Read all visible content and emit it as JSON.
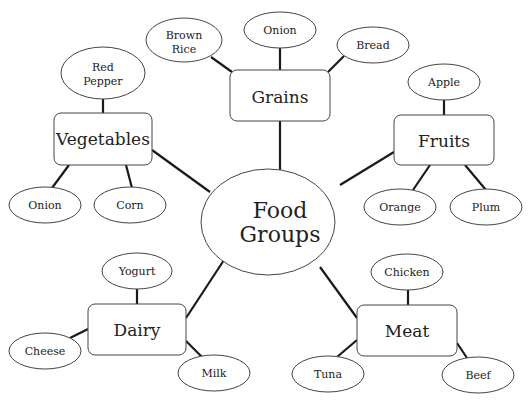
{
  "diagram": {
    "type": "concept-map",
    "center": {
      "label_line1": "Food",
      "label_line2": "Groups"
    },
    "categories": [
      {
        "id": "grains",
        "label": "Grains",
        "items": [
          {
            "line1": "Brown",
            "line2": "Rice"
          },
          {
            "line1": "Quinoa"
          },
          {
            "line1": "Bread"
          }
        ]
      },
      {
        "id": "vegetables",
        "label": "Vegetables",
        "items": [
          {
            "line1": "Red",
            "line2": "Pepper"
          },
          {
            "line1": "Onion"
          },
          {
            "line1": "Corn"
          }
        ]
      },
      {
        "id": "fruits",
        "label": "Fruits",
        "items": [
          {
            "line1": "Apple"
          },
          {
            "line1": "Orange"
          },
          {
            "line1": "Plum"
          }
        ]
      },
      {
        "id": "dairy",
        "label": "Dairy",
        "items": [
          {
            "line1": "Yogurt"
          },
          {
            "line1": "Cheese"
          },
          {
            "line1": "Milk"
          }
        ]
      },
      {
        "id": "meat",
        "label": "Meat",
        "items": [
          {
            "line1": "Chicken"
          },
          {
            "line1": "Tuna"
          },
          {
            "line1": "Beef"
          }
        ]
      }
    ],
    "colors": {
      "line": "#1a1a1a",
      "stroke": "#444444",
      "fill": "#ffffff",
      "text": "#222222"
    }
  }
}
